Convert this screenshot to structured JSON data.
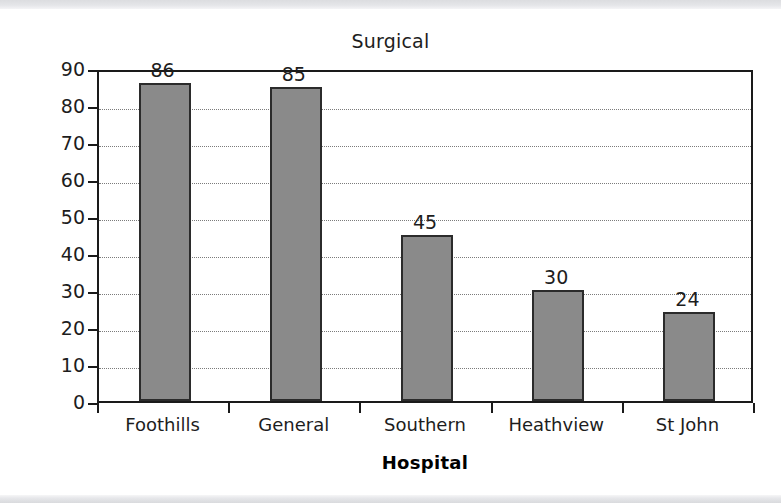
{
  "chart_data": {
    "type": "bar",
    "title": "Surgical",
    "xlabel": "Hospital",
    "ylabel": "Number of beds",
    "categories": [
      "Foothills",
      "General",
      "Southern",
      "Heathview",
      "St John"
    ],
    "values": [
      86,
      85,
      45,
      30,
      24
    ],
    "value_labels": [
      "86",
      "85",
      "45",
      "30",
      "24"
    ],
    "ylim": [
      0,
      90
    ],
    "ytick_step": 10,
    "yticks": [
      0,
      10,
      20,
      30,
      40,
      50,
      60,
      70,
      80,
      90
    ],
    "ytick_labels": [
      "0",
      "10",
      "20",
      "30",
      "40",
      "50",
      "60",
      "70",
      "80",
      "90"
    ],
    "grid": "horizontal-dotted",
    "legend": "none",
    "bar_fill_color": "#8a8a8a",
    "bar_edge_color": "#2b2b2b",
    "axis_color": "#1a1a1a",
    "gridline_color": "#7b7b7b",
    "background_color": "#ffffff"
  }
}
